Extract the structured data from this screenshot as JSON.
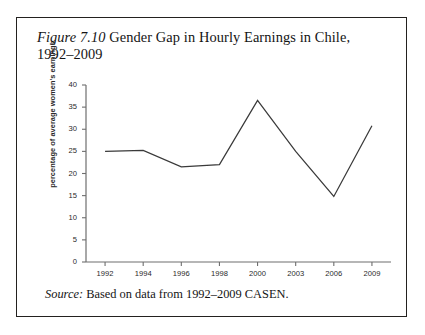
{
  "figure": {
    "label": "Figure 7.10",
    "title_text": " Gender Gap in Hourly Earnings in Chile, 1992–2009",
    "source_label": "Source:",
    "source_text": " Based on data from 1992–2009 CASEN."
  },
  "colors": {
    "line": "#3a3a3a",
    "axis": "#6e6e6e",
    "border": "#23211f",
    "text": "#141414",
    "background": "#ffffff"
  },
  "chart_data": {
    "type": "line",
    "title": "Figure 7.10 Gender Gap in Hourly Earnings in Chile, 1992–2009",
    "xlabel": "",
    "ylabel": "percentage of average women's earnings",
    "categories": [
      "1992",
      "1994",
      "1996",
      "1998",
      "2000",
      "2003",
      "2006",
      "2009"
    ],
    "values": [
      25.0,
      25.2,
      21.5,
      22.0,
      36.5,
      25.0,
      14.8,
      30.8
    ],
    "ylim": [
      0,
      40
    ],
    "yticks": [
      0,
      5,
      10,
      15,
      20,
      25,
      30,
      35,
      40
    ],
    "ytick_labels": [
      "0",
      "5",
      "10",
      "15",
      "20",
      "25",
      "30",
      "35",
      "40"
    ],
    "grid": false,
    "legend": "none",
    "series": [
      {
        "name": "Gender gap in hourly earnings",
        "values": [
          25.0,
          25.2,
          21.5,
          22.0,
          36.5,
          25.0,
          14.8,
          30.8
        ]
      }
    ]
  }
}
